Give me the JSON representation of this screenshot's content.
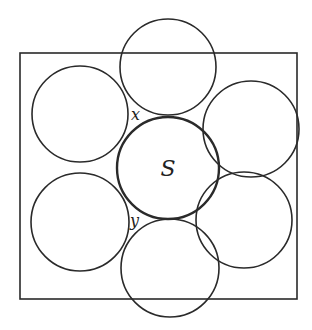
{
  "diagram": {
    "stroke_color": "#2a2a2a",
    "background": "#ffffff",
    "square": {
      "x": 20,
      "y": 53,
      "width": 277,
      "height": 246
    },
    "center_circle": {
      "cx": 168,
      "cy": 168,
      "r": 51,
      "label": "S"
    },
    "outer_circles": [
      {
        "name": "top",
        "cx": 168,
        "cy": 67,
        "r": 48
      },
      {
        "name": "upper-left",
        "cx": 80,
        "cy": 114,
        "r": 48
      },
      {
        "name": "upper-right",
        "cx": 251,
        "cy": 129,
        "r": 48
      },
      {
        "name": "lower-left",
        "cx": 80,
        "cy": 222,
        "r": 49
      },
      {
        "name": "lower-right",
        "cx": 244,
        "cy": 220,
        "r": 48
      },
      {
        "name": "bottom",
        "cx": 170,
        "cy": 268,
        "r": 49
      }
    ],
    "labels": [
      {
        "name": "x",
        "text": "x",
        "x": 131,
        "y": 120
      },
      {
        "name": "y",
        "text": "y",
        "x": 130,
        "y": 226
      }
    ]
  }
}
